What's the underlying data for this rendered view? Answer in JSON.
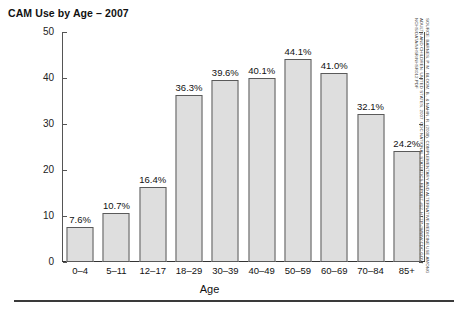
{
  "chart_data": {
    "type": "bar",
    "title": "CAM Use by Age – 2007",
    "xlabel": "Age",
    "ylabel": "",
    "categories": [
      "0–4",
      "5–11",
      "12–17",
      "18–29",
      "30–39",
      "40–49",
      "50–59",
      "60–69",
      "70–84",
      "85+"
    ],
    "values": [
      7.6,
      10.7,
      16.4,
      36.3,
      39.6,
      40.1,
      44.1,
      41.0,
      32.1,
      24.2
    ],
    "value_labels": [
      "7.6%",
      "10.7%",
      "16.4%",
      "36.3%",
      "39.6%",
      "40.1%",
      "44.1%",
      "41.0%",
      "32.1%",
      "24.2%"
    ],
    "ylim": [
      0,
      50
    ],
    "yticks": [
      0,
      10,
      20,
      30,
      40,
      50
    ],
    "ytick_labels": [
      "0",
      "10",
      "20",
      "30",
      "40",
      "50"
    ],
    "grid": false,
    "legend": "none",
    "bar_color": "#dedede",
    "bar_edge_color": "#5a5a5a",
    "axis_color": "#555555",
    "text_color": "#111111"
  },
  "source_note": {
    "line1": "SOURCE: BARNES, P. M., BLOOM, B., & NAHIN, R. (2008). COMPLEMENTARY AND ALTERNATIVE MEDICINE USE AMONG",
    "line2": "ADULTS AND CHILDREN: UNITED STATES, 2007. CDC NATIONAL STATISTICS REPORT #12. HTTP://WWW.CDC.GOV/",
    "line3": "NCHS/DATA/NHSR/NHSR012.PDF"
  }
}
